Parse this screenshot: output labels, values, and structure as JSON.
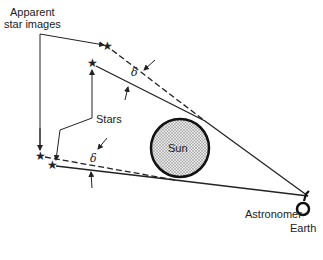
{
  "labels": {
    "apparent_line1": "Apparent",
    "apparent_line2": "star images",
    "stars": "Stars",
    "sun": "Sun",
    "astronomer": "Astronomer",
    "earth": "Earth",
    "delta": "δ"
  },
  "icons": {
    "star": "★"
  },
  "colors": {
    "line": "#222222",
    "sun_fill": "#bdbdbd",
    "background": "#ffffff"
  }
}
